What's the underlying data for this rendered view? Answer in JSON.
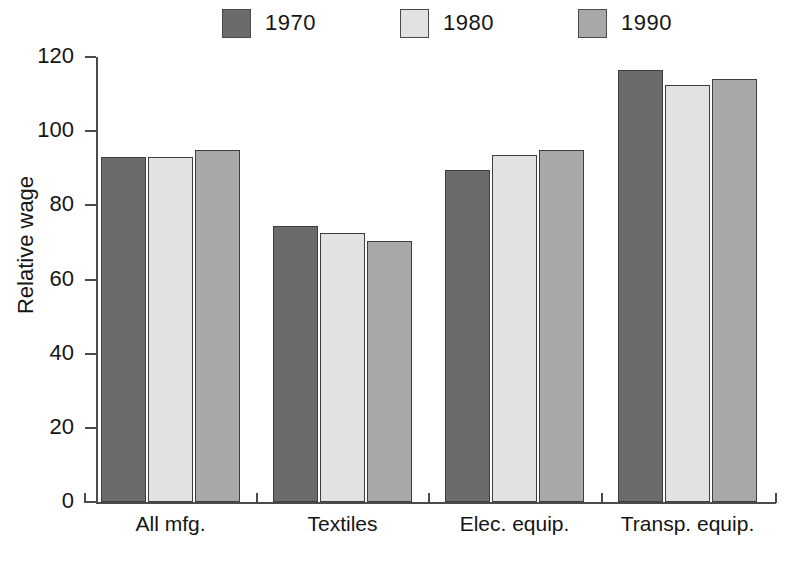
{
  "chart_data": {
    "type": "bar",
    "title": "",
    "xlabel": "",
    "ylabel": "Relative wage",
    "ylim": [
      0,
      120
    ],
    "yticks": [
      0,
      20,
      40,
      60,
      80,
      100,
      120
    ],
    "ytick_labels": [
      "0",
      "20",
      "40",
      "60",
      "80",
      "100",
      "120"
    ],
    "grid": false,
    "legend_position": "top",
    "categories": [
      "All mfg.",
      "Textiles",
      "Elec. equip.",
      "Transp. equip."
    ],
    "series": [
      {
        "name": "1970",
        "color": "#6b6b6b",
        "values": [
          93,
          74.5,
          89.5,
          116.5
        ]
      },
      {
        "name": "1980",
        "color": "#e2e2e2",
        "values": [
          93,
          72.5,
          93.5,
          112.5
        ]
      },
      {
        "name": "1990",
        "color": "#a8a8a8",
        "values": [
          95,
          70.5,
          95,
          114
        ]
      }
    ]
  },
  "legend": {
    "items": [
      {
        "label": "1970",
        "color": "#6b6b6b"
      },
      {
        "label": "1980",
        "color": "#e2e2e2"
      },
      {
        "label": "1990",
        "color": "#a8a8a8"
      }
    ]
  },
  "axes": {
    "y_title": "Relative wage"
  }
}
